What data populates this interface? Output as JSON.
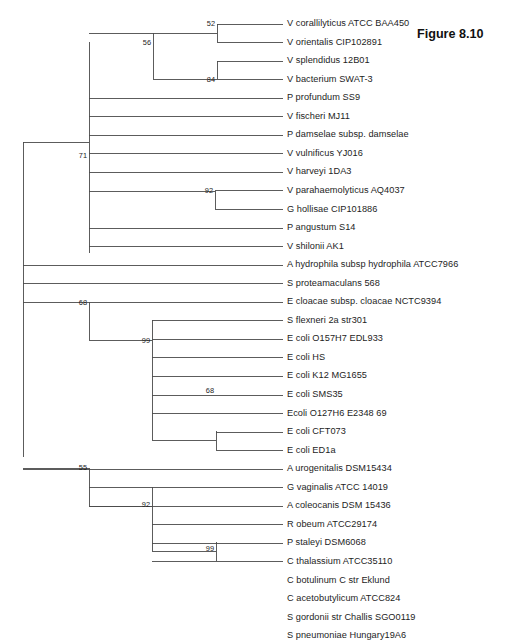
{
  "figure": {
    "caption": "Figure 8.10",
    "caption_x": 417,
    "caption_y": 27
  },
  "layout": {
    "tip_x": 283,
    "label_x": 287,
    "root_x": 23,
    "first_row_y": 24,
    "row_spacing": 18.55,
    "line_color": "#4a4a4a",
    "line_width": 0.9
  },
  "chart_data": {
    "type": "tree",
    "title": "Figure 8.10",
    "tree_kind": "phylogenetic-cladogram",
    "n_taxa": 29,
    "taxa": [
      "V corallilyticus ATCC BAA450",
      "V orientalis CIP102891",
      "V splendidus 12B01",
      "V bacterium SWAT-3",
      "P profundum SS9",
      "V fischeri MJ11",
      "P damselae subsp. damselae",
      "V vulnificus YJ016",
      "V harveyi 1DA3",
      "V parahaemolyticus AQ4037",
      "G hollisae CIP101886",
      "P angustum S14",
      "V shilonii AK1",
      "A hydrophila subsp hydrophila ATCC7966",
      "S proteamaculans 568",
      "E cloacae subsp. cloacae NCTC9394",
      "S flexneri 2a str301",
      "E coli O157H7 EDL933",
      "E coli HS",
      "E coli K12 MG1655",
      "E coli SMS35",
      "Ecoli O127H6 E2348 69",
      "E coli CFT073",
      "E coli ED1a",
      "A urogenitalis DSM15434",
      "G vaginalis ATCC 14019",
      "A coleocanis DSM 15436",
      "R obeum ATCC29174",
      "P staleyi DSM6068",
      "C thalassium ATCC35110",
      "C botulinum C str Eklund",
      "C acetobutylicum ATCC824",
      "S gordonii str Challis SGO0119",
      "S pneumoniae Hungary19A6"
    ],
    "bootstrap_values": [
      52,
      56,
      84,
      71,
      92,
      68,
      99,
      68,
      55,
      92,
      99
    ],
    "clades": [
      {
        "support": 52,
        "members": [
          "V corallilyticus ATCC BAA450",
          "V orientalis CIP102891"
        ]
      },
      {
        "support": 84,
        "members": [
          "V splendidus 12B01",
          "V bacterium SWAT-3"
        ]
      },
      {
        "support": 56,
        "members": [
          "V corallilyticus ATCC BAA450",
          "V orientalis CIP102891",
          "V splendidus 12B01",
          "V bacterium SWAT-3"
        ]
      },
      {
        "support": 92,
        "members": [
          "V parahaemolyticus AQ4037",
          "G hollisae CIP101886"
        ]
      },
      {
        "support": 71,
        "members": [
          "Vibrionaceae clade rows 1-13"
        ]
      },
      {
        "support": 68,
        "members": [
          "E coli CFT073",
          "E coli ED1a"
        ]
      },
      {
        "support": 99,
        "members": [
          "S flexneri 2a str301",
          "E coli O157H7 EDL933",
          "E coli HS",
          "E coli K12 MG1655",
          "E coli SMS35",
          "Ecoli O127H6 E2348 69",
          "E coli CFT073",
          "E coli ED1a"
        ]
      },
      {
        "support": 68,
        "members": [
          "E cloacae subsp. cloacae NCTC9394",
          "enterics clade"
        ]
      },
      {
        "support": 99,
        "members": [
          "S gordonii str Challis SGO0119",
          "S pneumoniae Hungary19A6"
        ]
      },
      {
        "support": 92,
        "members": [
          "R obeum ATCC29174",
          "P staleyi DSM6068",
          "C thalassium ATCC35110",
          "C botulinum C str Eklund",
          "C acetobutylicum ATCC824",
          "S gordonii str Challis SGO0119",
          "S pneumoniae Hungary19A6"
        ]
      },
      {
        "support": 55,
        "members": [
          "G vaginalis ATCC 14019",
          "A coleocanis DSM 15436",
          "Firmicutes clade"
        ]
      }
    ]
  },
  "tips": [
    {
      "label": "V corallilyticus ATCC BAA450",
      "row": 0,
      "branch_x": 217
    },
    {
      "label": "V orientalis CIP102891",
      "row": 1,
      "branch_x": 217
    },
    {
      "label": "V splendidus 12B01",
      "row": 2,
      "branch_x": 217
    },
    {
      "label": "V bacterium SWAT-3",
      "row": 3,
      "branch_x": 217
    },
    {
      "label": "P profundum SS9",
      "row": 4,
      "branch_x": 89
    },
    {
      "label": "V fischeri MJ11",
      "row": 5,
      "branch_x": 89
    },
    {
      "label": "P damselae subsp. damselae",
      "row": 6,
      "branch_x": 89
    },
    {
      "label": "V vulnificus YJ016",
      "row": 7,
      "branch_x": 89
    },
    {
      "label": "V harveyi 1DA3",
      "row": 8,
      "branch_x": 89
    },
    {
      "label": "V parahaemolyticus AQ4037",
      "row": 9,
      "branch_x": 215
    },
    {
      "label": "G hollisae CIP101886",
      "row": 10,
      "branch_x": 215
    },
    {
      "label": "P angustum S14",
      "row": 11,
      "branch_x": 89
    },
    {
      "label": "V shilonii AK1",
      "row": 12,
      "branch_x": 89
    },
    {
      "label": "A hydrophila subsp hydrophila ATCC7966",
      "row": 13,
      "branch_x": 23
    },
    {
      "label": "S proteamaculans 568",
      "row": 14,
      "branch_x": 23
    },
    {
      "label": "E cloacae subsp. cloacae NCTC9394",
      "row": 15,
      "branch_x": 89
    },
    {
      "label": "S flexneri 2a str301",
      "row": 16,
      "branch_x": 152
    },
    {
      "label": "E coli O157H7 EDL933",
      "row": 17,
      "branch_x": 152
    },
    {
      "label": "E coli HS",
      "row": 18,
      "branch_x": 152
    },
    {
      "label": "E coli K12 MG1655",
      "row": 19,
      "branch_x": 152
    },
    {
      "label": "E coli SMS35",
      "row": 20,
      "branch_x": 152
    },
    {
      "label": "Ecoli O127H6 E2348 69",
      "row": 21,
      "branch_x": 152
    },
    {
      "label": "E coli CFT073",
      "row": 22,
      "branch_x": 216
    },
    {
      "label": "E coli ED1a",
      "row": 23,
      "branch_x": 216
    },
    {
      "label": "A urogenitalis DSM15434",
      "row": 24,
      "branch_x": 23
    },
    {
      "label": "G vaginalis ATCC 14019",
      "row": 25,
      "branch_x": 89
    },
    {
      "label": "A coleocanis DSM 15436",
      "row": 26,
      "branch_x": 89
    },
    {
      "label": "R obeum ATCC29174",
      "row": 27,
      "branch_x": 152
    },
    {
      "label": "P staleyi DSM6068",
      "row": 28,
      "branch_x": 152
    },
    {
      "label": "C thalassium ATCC35110",
      "row": 29,
      "branch_x": 152
    },
    {
      "label": "C botulinum C str Eklund",
      "row": 30,
      "branch_x": 152
    },
    {
      "label": "C acetobutylicum ATCC824",
      "row": 31,
      "branch_x": 152
    },
    {
      "label": "S gordonii str Challis SGO0119",
      "row": 32,
      "branch_x": 216
    },
    {
      "label": "S pneumoniae Hungary19A6",
      "row": 33,
      "branch_x": 216
    }
  ],
  "bootstraps": [
    {
      "value": "52",
      "x": 215,
      "y": 20
    },
    {
      "value": "56",
      "x": 151,
      "y": 39
    },
    {
      "value": "84",
      "x": 215,
      "y": 76
    },
    {
      "value": "71",
      "x": 87,
      "y": 152
    },
    {
      "value": "92",
      "x": 213,
      "y": 187
    },
    {
      "value": "68",
      "x": 87,
      "y": 299
    },
    {
      "value": "99",
      "x": 150,
      "y": 337
    },
    {
      "value": "68",
      "x": 214,
      "y": 387
    },
    {
      "value": "55",
      "x": 87,
      "y": 464
    },
    {
      "value": "92",
      "x": 150,
      "y": 501
    },
    {
      "value": "99",
      "x": 214,
      "y": 545
    }
  ],
  "verticals": [
    {
      "name": "root-spine",
      "x": 23,
      "y1": 142,
      "y2": 457
    },
    {
      "name": "vibrio-node-71",
      "x": 89,
      "y1": 42,
      "y2": 253
    },
    {
      "name": "vibrio-clade-56",
      "x": 153,
      "y1": 33,
      "y2": 79
    },
    {
      "name": "clade-52",
      "x": 217,
      "y1": 24,
      "y2": 42
    },
    {
      "name": "clade-84",
      "x": 217,
      "y1": 61,
      "y2": 79
    },
    {
      "name": "clade-92-vibrio",
      "x": 215,
      "y1": 191,
      "y2": 209
    },
    {
      "name": "enteric-node-68",
      "x": 89,
      "y1": 302,
      "y2": 340
    },
    {
      "name": "ecoli-node-99",
      "x": 152,
      "y1": 320,
      "y2": 440
    },
    {
      "name": "clade-68-ecoli",
      "x": 216,
      "y1": 431,
      "y2": 450
    },
    {
      "name": "bottom-node-55",
      "x": 89,
      "y1": 468,
      "y2": 506
    },
    {
      "name": "firmicutes-node-92",
      "x": 152,
      "y1": 487,
      "y2": 551
    },
    {
      "name": "clade-99-strep",
      "x": 216,
      "y1": 542,
      "y2": 561
    }
  ],
  "connectors": [
    {
      "name": "root-to-vibrio-71",
      "x1": 23,
      "x2": 89,
      "y": 142
    },
    {
      "name": "node71-to-clade56",
      "x1": 89,
      "x2": 153,
      "y": 33
    },
    {
      "name": "clade56-to-52",
      "x1": 153,
      "x2": 217,
      "y": 33
    },
    {
      "name": "clade56-to-84",
      "x1": 153,
      "x2": 217,
      "y": 79
    },
    {
      "name": "node71-to-92",
      "x1": 89,
      "x2": 215,
      "y": 191
    },
    {
      "name": "root-to-enteric-68",
      "x1": 23,
      "x2": 89,
      "y": 302
    },
    {
      "name": "node68-to-99",
      "x1": 89,
      "x2": 152,
      "y": 340
    },
    {
      "name": "node99-to-68ecoli",
      "x1": 152,
      "x2": 216,
      "y": 440
    },
    {
      "name": "root-to-bottom-55",
      "x1": 23,
      "x2": 89,
      "y": 468
    },
    {
      "name": "node55-to-92",
      "x1": 89,
      "x2": 152,
      "y": 506
    },
    {
      "name": "node92-to-99strep",
      "x1": 152,
      "x2": 216,
      "y": 551
    }
  ]
}
